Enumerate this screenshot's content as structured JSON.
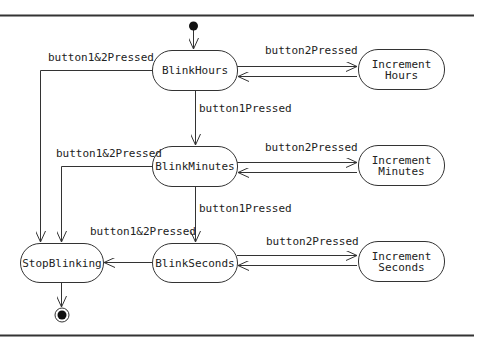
{
  "diagram": {
    "type": "uml-state-machine",
    "states": [
      {
        "id": "blink_hours",
        "label": "BlinkHours"
      },
      {
        "id": "increment_hours",
        "label": "Increment\nHours"
      },
      {
        "id": "blink_minutes",
        "label": "BlinkMinutes"
      },
      {
        "id": "increment_minutes",
        "label": "Increment\nMinutes"
      },
      {
        "id": "blink_seconds",
        "label": "BlinkSeconds"
      },
      {
        "id": "increment_seconds",
        "label": "Increment\nSeconds"
      },
      {
        "id": "stop_blinking",
        "label": "StopBlinking"
      }
    ],
    "transitions": [
      {
        "from": "initial",
        "to": "blink_hours",
        "label": ""
      },
      {
        "from": "blink_hours",
        "to": "increment_hours",
        "label": "button2Pressed"
      },
      {
        "from": "increment_hours",
        "to": "blink_hours",
        "label": ""
      },
      {
        "from": "blink_hours",
        "to": "blink_minutes",
        "label": "button1Pressed"
      },
      {
        "from": "blink_hours",
        "to": "stop_blinking",
        "label": "button1&2Pressed"
      },
      {
        "from": "blink_minutes",
        "to": "increment_minutes",
        "label": "button2Pressed"
      },
      {
        "from": "increment_minutes",
        "to": "blink_minutes",
        "label": ""
      },
      {
        "from": "blink_minutes",
        "to": "blink_seconds",
        "label": "button1Pressed"
      },
      {
        "from": "blink_minutes",
        "to": "stop_blinking",
        "label": "button1&2Pressed"
      },
      {
        "from": "blink_seconds",
        "to": "increment_seconds",
        "label": "button2Pressed"
      },
      {
        "from": "increment_seconds",
        "to": "blink_seconds",
        "label": ""
      },
      {
        "from": "blink_seconds",
        "to": "stop_blinking",
        "label": "button1&2Pressed"
      },
      {
        "from": "stop_blinking",
        "to": "final",
        "label": ""
      }
    ]
  }
}
